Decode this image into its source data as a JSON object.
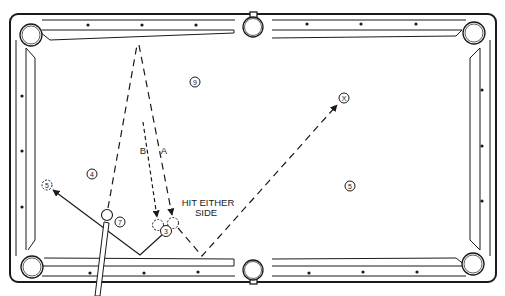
{
  "diagram": {
    "type": "pool-table-shot-diagram",
    "colors": {
      "line": "#1a1a1a",
      "background": "#ffffff"
    },
    "labels": {
      "path_a": "A",
      "path_b": "B",
      "note_line1": "HIT EITHER",
      "note_line2": "SIDE"
    },
    "balls": [
      {
        "id": "ball-9",
        "label": "9",
        "x": 195,
        "y": 82,
        "style": "numbered"
      },
      {
        "id": "target-x",
        "label": "X",
        "x": 344,
        "y": 98,
        "style": "numbered"
      },
      {
        "id": "ball-4",
        "label": "4",
        "x": 92,
        "y": 174,
        "style": "numbered"
      },
      {
        "id": "ghost-5",
        "label": "5",
        "x": 47,
        "y": 185,
        "style": "ghost"
      },
      {
        "id": "ball-7",
        "label": "7",
        "x": 120,
        "y": 222,
        "style": "numbered"
      },
      {
        "id": "ball-3",
        "label": "3",
        "x": 166,
        "y": 231,
        "style": "numbered"
      },
      {
        "id": "ball-5",
        "label": "5",
        "x": 350,
        "y": 186,
        "style": "numbered"
      }
    ],
    "cue_ball": {
      "x": 107,
      "y": 215
    },
    "ghost_balls": [
      {
        "id": "ghost-b",
        "x": 158,
        "y": 225
      },
      {
        "id": "ghost-a",
        "x": 173,
        "y": 223
      }
    ]
  }
}
